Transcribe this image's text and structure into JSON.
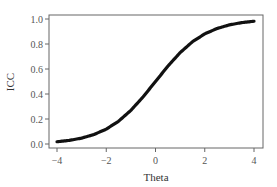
{
  "chart_data": {
    "type": "line",
    "title": "",
    "xlabel": "Theta",
    "ylabel": "ICC",
    "xlim": [
      -4,
      4
    ],
    "ylim": [
      0,
      1
    ],
    "xticks": [
      -4,
      -2,
      0,
      2,
      4
    ],
    "xtick_labels": [
      "−4",
      "−2",
      "0",
      "2",
      "4"
    ],
    "yticks": [
      0.0,
      0.2,
      0.4,
      0.6,
      0.8,
      1.0
    ],
    "ytick_labels": [
      "0.0",
      "0.2",
      "0.4",
      "0.6",
      "0.8",
      "1.0"
    ],
    "grid": false,
    "legend": null,
    "series": [
      {
        "name": "ICC",
        "color": "#111111",
        "x": [
          -4,
          -3.5,
          -3,
          -2.5,
          -2,
          -1.5,
          -1,
          -0.5,
          0,
          0.5,
          1,
          1.5,
          2,
          2.5,
          3,
          3.5,
          4
        ],
        "y": [
          0.018,
          0.029,
          0.047,
          0.076,
          0.119,
          0.182,
          0.269,
          0.378,
          0.5,
          0.622,
          0.731,
          0.818,
          0.881,
          0.924,
          0.953,
          0.971,
          0.982
        ]
      }
    ]
  }
}
